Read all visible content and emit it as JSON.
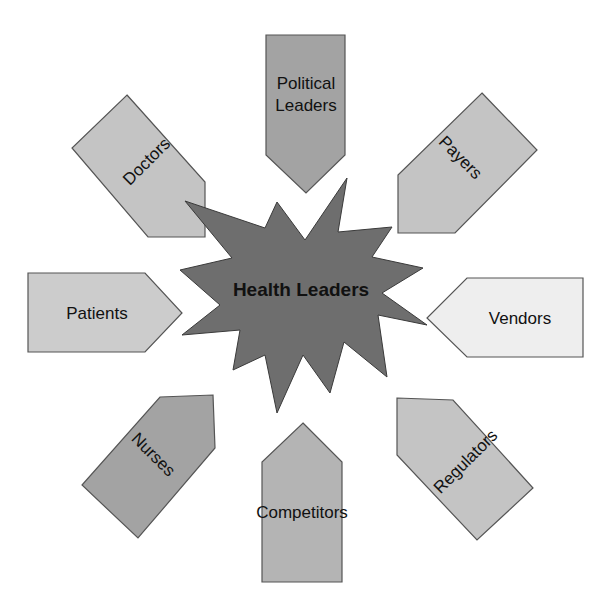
{
  "diagram": {
    "center": {
      "label": "Health Leaders",
      "shape": "starburst",
      "fill": "#6e6e6e",
      "points": [
        [
          185,
          201
        ],
        [
          265,
          228
        ],
        [
          277,
          202
        ],
        [
          305,
          240
        ],
        [
          347,
          178
        ],
        [
          338,
          232
        ],
        [
          392,
          227
        ],
        [
          372,
          257
        ],
        [
          423,
          268
        ],
        [
          382,
          293
        ],
        [
          427,
          325
        ],
        [
          378,
          315
        ],
        [
          387,
          377
        ],
        [
          344,
          342
        ],
        [
          330,
          393
        ],
        [
          303,
          355
        ],
        [
          277,
          413
        ],
        [
          265,
          355
        ],
        [
          233,
          370
        ],
        [
          240,
          330
        ],
        [
          182,
          335
        ],
        [
          220,
          305
        ],
        [
          180,
          270
        ],
        [
          232,
          258
        ]
      ]
    },
    "nodes": [
      {
        "id": "political-leaders",
        "lines": [
          "Political",
          "Leaders"
        ],
        "fill": "#a3a3a3",
        "points": [
          [
            266,
            35
          ],
          [
            345,
            35
          ],
          [
            345,
            155
          ],
          [
            306,
            193
          ],
          [
            266,
            155
          ]
        ],
        "text_x": 306,
        "text_y": 100,
        "rotate": 0
      },
      {
        "id": "payers",
        "lines": [
          "Payers"
        ],
        "fill": "#c4c4c4",
        "points": [
          [
            482,
            93
          ],
          [
            537,
            150
          ],
          [
            455,
            233
          ],
          [
            398,
            233
          ],
          [
            398,
            175
          ]
        ],
        "text_x": 460,
        "text_y": 163,
        "rotate": 45
      },
      {
        "id": "vendors",
        "lines": [
          "Vendors"
        ],
        "fill": "#eeeeee",
        "points": [
          [
            467,
            278
          ],
          [
            583,
            278
          ],
          [
            583,
            357
          ],
          [
            467,
            357
          ],
          [
            427,
            318
          ]
        ],
        "text_x": 520,
        "text_y": 324,
        "rotate": 0
      },
      {
        "id": "regulators",
        "lines": [
          "Regulators"
        ],
        "fill": "#c4c4c4",
        "points": [
          [
            397,
            398
          ],
          [
            453,
            400
          ],
          [
            533,
            488
          ],
          [
            477,
            540
          ],
          [
            397,
            455
          ]
        ],
        "text_x": 466,
        "text_y": 467,
        "rotate": -45
      },
      {
        "id": "competitors",
        "lines": [
          "Competitors"
        ],
        "fill": "#b4b4b4",
        "points": [
          [
            303,
            423
          ],
          [
            342,
            462
          ],
          [
            342,
            582
          ],
          [
            262,
            582
          ],
          [
            262,
            462
          ]
        ],
        "text_x": 302,
        "text_y": 518,
        "rotate": 0
      },
      {
        "id": "nurses",
        "lines": [
          "Nurses"
        ],
        "fill": "#a3a3a3",
        "points": [
          [
            160,
            397
          ],
          [
            213,
            395
          ],
          [
            215,
            448
          ],
          [
            138,
            538
          ],
          [
            82,
            485
          ]
        ],
        "text_x": 153,
        "text_y": 460,
        "rotate": 45
      },
      {
        "id": "patients",
        "lines": [
          "Patients"
        ],
        "fill": "#cccccc",
        "points": [
          [
            28,
            273
          ],
          [
            145,
            273
          ],
          [
            182,
            313
          ],
          [
            145,
            352
          ],
          [
            28,
            352
          ]
        ],
        "text_x": 97,
        "text_y": 319,
        "rotate": 0
      },
      {
        "id": "doctors",
        "lines": [
          "Doctors"
        ],
        "fill": "#c4c4c4",
        "points": [
          [
            127,
            95
          ],
          [
            205,
            182
          ],
          [
            205,
            237
          ],
          [
            148,
            237
          ],
          [
            72,
            148
          ]
        ],
        "text_x": 147,
        "text_y": 167,
        "rotate": -45
      }
    ],
    "stroke_color": "#555555",
    "background": "#ffffff"
  }
}
